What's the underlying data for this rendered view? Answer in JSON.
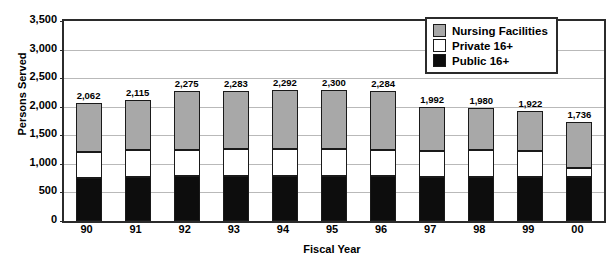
{
  "chart_data": {
    "type": "bar",
    "subtype": "stacked-bar",
    "title": "",
    "xlabel": "Fiscal Year",
    "ylabel": "Persons Served",
    "ylim": [
      0,
      3500
    ],
    "ytick_step": 500,
    "yticks": [
      "0",
      "500",
      "1,000",
      "1,500",
      "2,000",
      "2,500",
      "3,000",
      "3,500"
    ],
    "grid": true,
    "legend_position": "top-right",
    "categories": [
      "90",
      "91",
      "92",
      "93",
      "94",
      "95",
      "96",
      "97",
      "98",
      "99",
      "00"
    ],
    "series": [
      {
        "name": "Public 16+",
        "color": "#0d0d0d",
        "values": [
          752,
          765,
          780,
          782,
          785,
          780,
          782,
          762,
          768,
          770,
          772
        ]
      },
      {
        "name": "Private 16+",
        "color": "#ffffff",
        "values": [
          455,
          470,
          470,
          476,
          470,
          480,
          468,
          470,
          470,
          455,
          160
        ]
      },
      {
        "name": "Nursing Facilities",
        "color": "#a8a8a8",
        "values": [
          855,
          880,
          1025,
          1025,
          1037,
          1040,
          1034,
          760,
          742,
          697,
          804
        ]
      }
    ],
    "totals": [
      2062,
      2115,
      2275,
      2283,
      2292,
      2300,
      2284,
      1992,
      1980,
      1922,
      1736
    ],
    "total_labels": [
      "2,062",
      "2,115",
      "2,275",
      "2,283",
      "2,292",
      "2,300",
      "2,284",
      "1,992",
      "1,980",
      "1,922",
      "1,736"
    ]
  },
  "legend": {
    "items": [
      {
        "label": "Nursing Facilities",
        "swatch": "nurs"
      },
      {
        "label": "Private 16+",
        "swatch": "priv"
      },
      {
        "label": "Public 16+",
        "swatch": "pub"
      }
    ]
  },
  "axes": {
    "y_title": "Persons Served",
    "x_title": "Fiscal Year"
  }
}
